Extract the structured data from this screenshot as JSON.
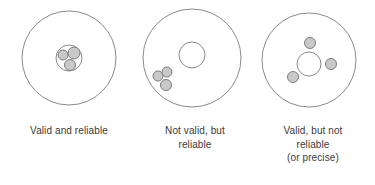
{
  "figure": {
    "name": "validity-reliability-target-diagram",
    "background_color": "#ffffff",
    "width": 375,
    "height": 185
  },
  "style": {
    "ring_stroke": "#8a8a8a",
    "ring_fill": "none",
    "dot_fill": "#c9c9c9",
    "dot_stroke": "#7d7d7d",
    "caption_color": "#3a3a3a"
  },
  "targets": [
    {
      "id": "target-valid-and-reliable",
      "caption": "Valid and reliable",
      "outer_circle": {
        "cx": 69,
        "cy": 58,
        "r": 47
      },
      "inner_circle": {
        "cx": 69,
        "cy": 58,
        "r": 13
      },
      "dots": [
        {
          "cx": 63,
          "cy": 55,
          "r": 5
        },
        {
          "cx": 74,
          "cy": 53,
          "r": 6
        },
        {
          "cx": 70,
          "cy": 65,
          "r": 5.5
        }
      ]
    },
    {
      "id": "target-not-valid-but-reliable",
      "caption": "Not valid, but\nreliable",
      "outer_circle": {
        "cx": 192,
        "cy": 58,
        "r": 49
      },
      "inner_circle": {
        "cx": 192,
        "cy": 55,
        "r": 13
      },
      "dots": [
        {
          "cx": 158,
          "cy": 76,
          "r": 5
        },
        {
          "cx": 167,
          "cy": 72,
          "r": 5
        },
        {
          "cx": 166,
          "cy": 85,
          "r": 5.5
        }
      ]
    },
    {
      "id": "target-valid-but-not-reliable",
      "caption": "Valid, but not\nreliable\n(or precise)",
      "outer_circle": {
        "cx": 309,
        "cy": 60,
        "r": 47
      },
      "inner_circle": {
        "cx": 309,
        "cy": 64,
        "r": 12
      },
      "dots": [
        {
          "cx": 310,
          "cy": 43,
          "r": 5.5
        },
        {
          "cx": 331,
          "cy": 64,
          "r": 5.5
        },
        {
          "cx": 293,
          "cy": 77,
          "r": 5.5
        }
      ]
    }
  ]
}
